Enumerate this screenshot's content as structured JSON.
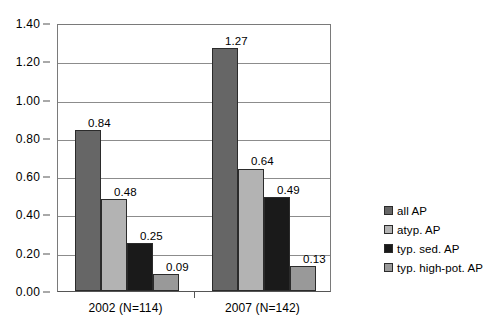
{
  "chart_data": {
    "type": "bar",
    "title": "",
    "subtitle": "",
    "xlabel": "",
    "ylabel": "",
    "categories": [
      "2002 (N=114)",
      "2007 (N=142)"
    ],
    "series": [
      {
        "name": "all AP",
        "values": [
          0.84,
          1.27
        ],
        "color": "#666666"
      },
      {
        "name": "atyp. AP",
        "values": [
          0.48,
          0.64
        ],
        "color": "#b3b3b3"
      },
      {
        "name": "typ. sed. AP",
        "values": [
          0.25,
          0.49
        ],
        "color": "#1a1a1a"
      },
      {
        "name": "typ. high-pot. AP",
        "values": [
          0.09,
          0.13
        ],
        "color": "#999999"
      }
    ],
    "data_labels": [
      [
        "0.84",
        "0.48",
        "0.25",
        "0.09"
      ],
      [
        "1.27",
        "0.64",
        "0.49",
        "0.13"
      ]
    ],
    "ylim": [
      0.0,
      1.4
    ],
    "ytick_step": 0.2,
    "ytick_labels": [
      "0.00",
      "0.20",
      "0.40",
      "0.60",
      "0.80",
      "1.00",
      "1.20",
      "1.40"
    ],
    "ytick_values": [
      0.0,
      0.2,
      0.4,
      0.6,
      0.8,
      1.0,
      1.2,
      1.4
    ],
    "grid": true,
    "grid_axis": "y",
    "legend_position": "right",
    "legend_labels": [
      "all AP",
      "atyp. AP",
      "typ. sed. AP",
      "typ. high-pot. AP"
    ]
  }
}
